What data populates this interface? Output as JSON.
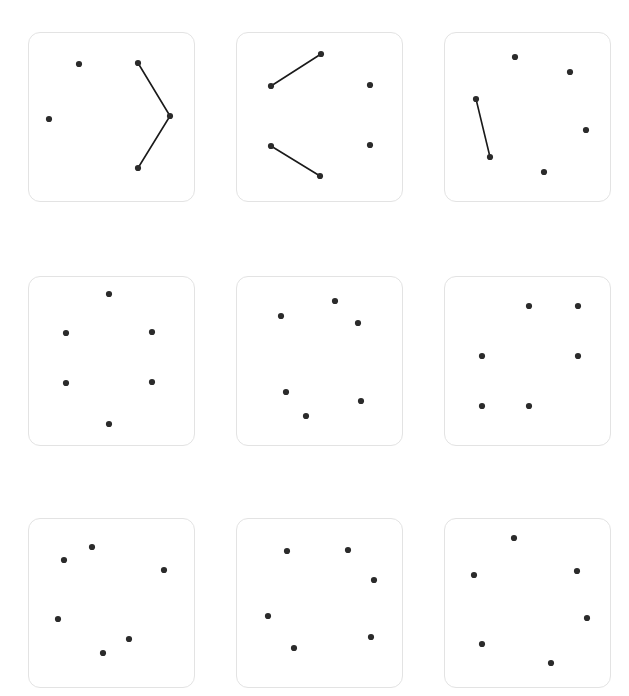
{
  "canvas": {
    "width": 629,
    "height": 696,
    "background": "#ffffff"
  },
  "style": {
    "panel_fill": "#ffffff",
    "panel_stroke": "#e3e3e3",
    "panel_stroke_width": 1.4,
    "panel_corner_radius": 12,
    "dot_color": "#2b2b2b",
    "dot_radius": 3.1,
    "edge_color": "#1a1a1a",
    "edge_width": 1.6
  },
  "layout": {
    "rows": 3,
    "cols": 3,
    "panel_count": 9,
    "panel_width": 167,
    "panel_height": 170,
    "col_x": [
      28,
      236,
      444
    ],
    "row_y": [
      32,
      276,
      518
    ]
  },
  "chart_data": {
    "type": "scatter",
    "title": "",
    "subtitle": "",
    "xlabel": "",
    "ylabel": "",
    "grid": false,
    "legend": "none",
    "panels": [
      {
        "index": 0,
        "row": 0,
        "col": 0,
        "name": "panel-1",
        "dot_count": 5,
        "edge_count": 2,
        "dots": [
          {
            "id": "p1d1",
            "x": 79,
            "y": 64
          },
          {
            "id": "p1d2",
            "x": 138,
            "y": 63
          },
          {
            "id": "p1d3",
            "x": 49,
            "y": 119
          },
          {
            "id": "p1d4",
            "x": 170,
            "y": 116
          },
          {
            "id": "p1d5",
            "x": 138,
            "y": 168
          }
        ],
        "edges": [
          {
            "from": "p1d2",
            "to": "p1d4"
          },
          {
            "from": "p1d4",
            "to": "p1d5"
          }
        ]
      },
      {
        "index": 1,
        "row": 0,
        "col": 1,
        "name": "panel-2",
        "dot_count": 6,
        "edge_count": 2,
        "dots": [
          {
            "id": "p2d1",
            "x": 321,
            "y": 54
          },
          {
            "id": "p2d2",
            "x": 271,
            "y": 86
          },
          {
            "id": "p2d3",
            "x": 370,
            "y": 85
          },
          {
            "id": "p2d4",
            "x": 271,
            "y": 146
          },
          {
            "id": "p2d5",
            "x": 370,
            "y": 145
          },
          {
            "id": "p2d6",
            "x": 320,
            "y": 176
          }
        ],
        "edges": [
          {
            "from": "p2d2",
            "to": "p2d1"
          },
          {
            "from": "p2d4",
            "to": "p2d6"
          }
        ]
      },
      {
        "index": 2,
        "row": 0,
        "col": 2,
        "name": "panel-3",
        "dot_count": 6,
        "edge_count": 1,
        "dots": [
          {
            "id": "p3d1",
            "x": 515,
            "y": 57
          },
          {
            "id": "p3d2",
            "x": 570,
            "y": 72
          },
          {
            "id": "p3d3",
            "x": 476,
            "y": 99
          },
          {
            "id": "p3d4",
            "x": 586,
            "y": 130
          },
          {
            "id": "p3d5",
            "x": 490,
            "y": 157
          },
          {
            "id": "p3d6",
            "x": 544,
            "y": 172
          }
        ],
        "edges": [
          {
            "from": "p3d3",
            "to": "p3d5"
          }
        ]
      },
      {
        "index": 3,
        "row": 1,
        "col": 0,
        "name": "panel-4",
        "dot_count": 6,
        "edge_count": 0,
        "dots": [
          {
            "id": "p4d1",
            "x": 109,
            "y": 294
          },
          {
            "id": "p4d2",
            "x": 66,
            "y": 333
          },
          {
            "id": "p4d3",
            "x": 152,
            "y": 332
          },
          {
            "id": "p4d4",
            "x": 66,
            "y": 383
          },
          {
            "id": "p4d5",
            "x": 152,
            "y": 382
          },
          {
            "id": "p4d6",
            "x": 109,
            "y": 424
          }
        ],
        "edges": []
      },
      {
        "index": 4,
        "row": 1,
        "col": 1,
        "name": "panel-5",
        "dot_count": 6,
        "edge_count": 0,
        "dots": [
          {
            "id": "p5d1",
            "x": 335,
            "y": 301
          },
          {
            "id": "p5d2",
            "x": 281,
            "y": 316
          },
          {
            "id": "p5d3",
            "x": 358,
            "y": 323
          },
          {
            "id": "p5d4",
            "x": 286,
            "y": 392
          },
          {
            "id": "p5d5",
            "x": 361,
            "y": 401
          },
          {
            "id": "p5d6",
            "x": 306,
            "y": 416
          }
        ],
        "edges": []
      },
      {
        "index": 5,
        "row": 1,
        "col": 2,
        "name": "panel-6",
        "dot_count": 6,
        "edge_count": 0,
        "dots": [
          {
            "id": "p6d1",
            "x": 529,
            "y": 306
          },
          {
            "id": "p6d2",
            "x": 578,
            "y": 306
          },
          {
            "id": "p6d3",
            "x": 482,
            "y": 356
          },
          {
            "id": "p6d4",
            "x": 578,
            "y": 356
          },
          {
            "id": "p6d5",
            "x": 482,
            "y": 406
          },
          {
            "id": "p6d6",
            "x": 529,
            "y": 406
          }
        ],
        "edges": []
      },
      {
        "index": 6,
        "row": 2,
        "col": 0,
        "name": "panel-7",
        "dot_count": 6,
        "edge_count": 0,
        "dots": [
          {
            "id": "p7d1",
            "x": 92,
            "y": 547
          },
          {
            "id": "p7d2",
            "x": 64,
            "y": 560
          },
          {
            "id": "p7d3",
            "x": 164,
            "y": 570
          },
          {
            "id": "p7d4",
            "x": 58,
            "y": 619
          },
          {
            "id": "p7d5",
            "x": 129,
            "y": 639
          },
          {
            "id": "p7d6",
            "x": 103,
            "y": 653
          }
        ],
        "edges": []
      },
      {
        "index": 7,
        "row": 2,
        "col": 1,
        "name": "panel-8",
        "dot_count": 6,
        "edge_count": 0,
        "dots": [
          {
            "id": "p8d1",
            "x": 287,
            "y": 551
          },
          {
            "id": "p8d2",
            "x": 348,
            "y": 550
          },
          {
            "id": "p8d3",
            "x": 374,
            "y": 580
          },
          {
            "id": "p8d4",
            "x": 268,
            "y": 616
          },
          {
            "id": "p8d5",
            "x": 371,
            "y": 637
          },
          {
            "id": "p8d6",
            "x": 294,
            "y": 648
          }
        ],
        "edges": []
      },
      {
        "index": 8,
        "row": 2,
        "col": 2,
        "name": "panel-9",
        "dot_count": 6,
        "edge_count": 0,
        "dots": [
          {
            "id": "p9d1",
            "x": 514,
            "y": 538
          },
          {
            "id": "p9d2",
            "x": 474,
            "y": 575
          },
          {
            "id": "p9d3",
            "x": 577,
            "y": 571
          },
          {
            "id": "p9d4",
            "x": 587,
            "y": 618
          },
          {
            "id": "p9d5",
            "x": 482,
            "y": 644
          },
          {
            "id": "p9d6",
            "x": 551,
            "y": 663
          }
        ],
        "edges": []
      }
    ]
  }
}
